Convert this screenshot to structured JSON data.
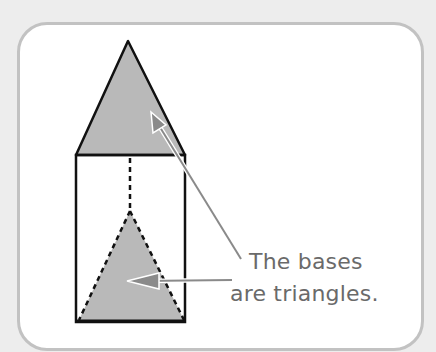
{
  "figure": {
    "annotation": {
      "line1": "The bases",
      "line2": "are triangles."
    },
    "colors": {
      "background": "#ededed",
      "card": "#ffffff",
      "card_border": "#c2c2c2",
      "shape_fill": "#b9b9b9",
      "outline": "#111111",
      "arrow": "#8a8a8a",
      "text": "#6a6a6a"
    }
  }
}
